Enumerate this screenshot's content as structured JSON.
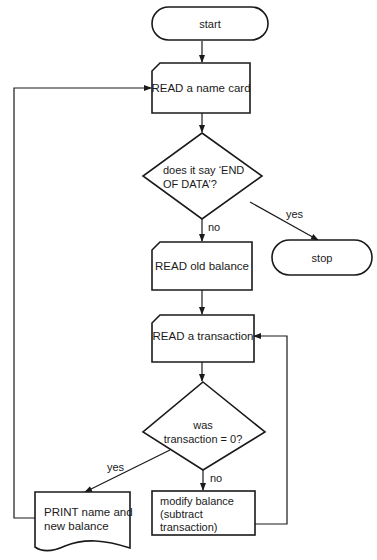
{
  "diagram": {
    "type": "flowchart",
    "nodes": {
      "start": {
        "label": "start",
        "shape": "terminal"
      },
      "read_name_card": {
        "label": "READ a name card",
        "shape": "card-input"
      },
      "decision_end_of_data": {
        "line1": "does it say ‘END",
        "line2": "OF DATA’?",
        "shape": "diamond"
      },
      "stop": {
        "label": "stop",
        "shape": "terminal"
      },
      "read_old_balance": {
        "label": "READ old balance",
        "shape": "card-input"
      },
      "read_transaction": {
        "label": "READ a transaction",
        "shape": "card-input"
      },
      "decision_transaction_zero": {
        "line1": "was",
        "line2": "transaction = 0?",
        "shape": "diamond"
      },
      "print_balance": {
        "line1": "PRINT name and",
        "line2": "new balance",
        "shape": "document"
      },
      "modify_balance": {
        "line1": "modify balance",
        "line2": "(subtract",
        "line3": "transaction)",
        "shape": "process"
      }
    },
    "edge_labels": {
      "end_yes": "yes",
      "end_no": "no",
      "zero_yes": "yes",
      "zero_no": "no"
    },
    "edges": [
      {
        "from": "start",
        "to": "read_name_card"
      },
      {
        "from": "read_name_card",
        "to": "decision_end_of_data"
      },
      {
        "from": "decision_end_of_data",
        "to": "stop",
        "label": "yes"
      },
      {
        "from": "decision_end_of_data",
        "to": "read_old_balance",
        "label": "no"
      },
      {
        "from": "read_old_balance",
        "to": "read_transaction"
      },
      {
        "from": "read_transaction",
        "to": "decision_transaction_zero"
      },
      {
        "from": "decision_transaction_zero",
        "to": "print_balance",
        "label": "yes"
      },
      {
        "from": "decision_transaction_zero",
        "to": "modify_balance",
        "label": "no"
      },
      {
        "from": "modify_balance",
        "to": "read_transaction"
      },
      {
        "from": "print_balance",
        "to": "read_name_card"
      }
    ],
    "colors": {
      "stroke": "#1a1a1a",
      "background": "#ffffff"
    }
  }
}
